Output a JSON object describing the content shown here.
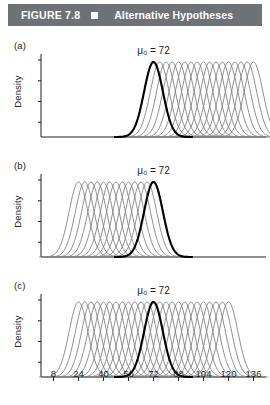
{
  "header": {
    "figure_number": "FIGURE 7.8",
    "bullet_icon": "filled-square",
    "title": "Alternative Hypotheses",
    "bar_color": "#6e7277",
    "text_color": "#ffffff"
  },
  "colors": {
    "null_curve": "#000000",
    "alternative_curve": "#808285",
    "axis": "#231f20",
    "background": "#ffffff"
  },
  "panels": [
    {
      "label": "(a)",
      "ylabel": "Density",
      "annotation": "μ₀ = 72",
      "null_mean": 72,
      "alternatives_side": "right",
      "alternative_means": [
        72,
        76,
        80,
        84,
        88,
        92,
        96,
        100,
        104,
        108,
        112,
        116,
        120,
        124,
        128,
        132,
        136
      ]
    },
    {
      "label": "(b)",
      "ylabel": "Density",
      "annotation": "μ₀ = 72",
      "null_mean": 72,
      "alternatives_side": "left",
      "alternative_means": [
        24,
        28,
        32,
        36,
        40,
        44,
        48,
        52,
        56,
        60,
        64,
        68,
        72
      ]
    },
    {
      "label": "(c)",
      "ylabel": "Density",
      "annotation": "μ₀ = 72",
      "null_mean": 72,
      "alternatives_side": "both",
      "alternative_means": [
        24,
        28,
        32,
        36,
        40,
        44,
        48,
        52,
        56,
        60,
        64,
        68,
        72,
        76,
        80,
        84,
        88,
        92,
        96,
        100,
        104,
        108,
        112,
        116,
        120
      ]
    }
  ],
  "chart_data": {
    "type": "line",
    "title": "Alternative Hypotheses",
    "xlabel": "",
    "ylabel": "Density",
    "xlim": [
      0,
      144
    ],
    "ylim": [
      0,
      1
    ],
    "grid": false,
    "legend": "none",
    "xticks": [
      8,
      24,
      40,
      56,
      72,
      88,
      104,
      120,
      136
    ],
    "xtick_labels": [
      "8",
      "24",
      "40",
      "56",
      "72",
      "88",
      "104",
      "120",
      "136"
    ],
    "yticks": [],
    "curve_sd": 6,
    "null_hypothesis_mean": 72,
    "annotations": [
      "μ₀ = 72",
      "μ₀ = 72",
      "μ₀ = 72"
    ],
    "series": [
      {
        "name": "(a) alternatives greater than 72",
        "panel": "(a)",
        "style": "gray",
        "means": [
          72,
          76,
          80,
          84,
          88,
          92,
          96,
          100,
          104,
          108,
          112,
          116,
          120,
          124,
          128,
          132,
          136
        ]
      },
      {
        "name": "(a) null hypothesis",
        "panel": "(a)",
        "style": "bold-black",
        "means": [
          72
        ]
      },
      {
        "name": "(b) alternatives less than 72",
        "panel": "(b)",
        "style": "gray",
        "means": [
          24,
          28,
          32,
          36,
          40,
          44,
          48,
          52,
          56,
          60,
          64,
          68,
          72
        ]
      },
      {
        "name": "(b) null hypothesis",
        "panel": "(b)",
        "style": "bold-black",
        "means": [
          72
        ]
      },
      {
        "name": "(c) alternatives not equal to 72",
        "panel": "(c)",
        "style": "gray",
        "means": [
          24,
          28,
          32,
          36,
          40,
          44,
          48,
          52,
          56,
          60,
          64,
          68,
          72,
          76,
          80,
          84,
          88,
          92,
          96,
          100,
          104,
          108,
          112,
          116,
          120
        ]
      },
      {
        "name": "(c) null hypothesis",
        "panel": "(c)",
        "style": "bold-black",
        "means": [
          72
        ]
      }
    ]
  },
  "xaxis": {
    "ticks": [
      "8",
      "24",
      "40",
      "56",
      "72",
      "88",
      "104",
      "120",
      "136"
    ]
  }
}
